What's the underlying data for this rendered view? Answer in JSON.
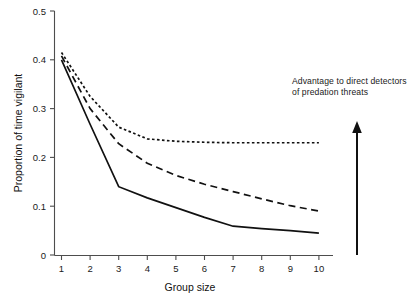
{
  "chart_data": {
    "type": "line",
    "title": "",
    "xlabel": "Group size",
    "ylabel": "Proportion of time vigilant",
    "x": [
      1,
      2,
      3,
      4,
      5,
      6,
      7,
      8,
      9,
      10
    ],
    "xlim": [
      1,
      10
    ],
    "ylim": [
      0,
      0.5
    ],
    "xticks": [
      "1",
      "2",
      "3",
      "4",
      "5",
      "6",
      "7",
      "8",
      "9",
      "10"
    ],
    "yticks": [
      "0",
      "0.1",
      "0.2",
      "0.3",
      "0.4",
      "0.5"
    ],
    "grid": false,
    "legend": "none",
    "series": [
      {
        "name": "dotted-upper",
        "style": "dotted",
        "values": [
          0.415,
          0.325,
          0.262,
          0.238,
          0.233,
          0.231,
          0.23,
          0.23,
          0.23,
          0.23
        ]
      },
      {
        "name": "dashed-middle",
        "style": "dashed",
        "values": [
          0.408,
          0.3,
          0.228,
          0.188,
          0.163,
          0.145,
          0.13,
          0.115,
          0.101,
          0.09
        ]
      },
      {
        "name": "solid-lower",
        "style": "solid",
        "values": [
          0.4,
          0.268,
          0.14,
          0.117,
          0.097,
          0.077,
          0.059,
          0.054,
          0.05,
          0.045
        ]
      }
    ],
    "annotations": [
      {
        "name": "advantage-note",
        "text": "Advantage to direct detectors\nof predation threats"
      }
    ],
    "arrow": {
      "name": "upward-advantage-arrow",
      "direction": "up"
    }
  }
}
